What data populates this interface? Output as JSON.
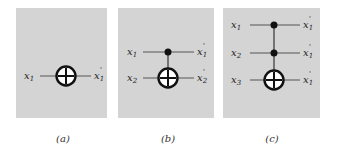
{
  "panels": [
    {
      "id": "a",
      "caption": "(a)",
      "inputs": [
        "x",
        "1"
      ],
      "gate": "NOT"
    },
    {
      "id": "b",
      "caption": "(b)",
      "gate": "CNOT"
    },
    {
      "id": "c",
      "caption": "(c)",
      "gate": "Toffoli"
    }
  ],
  "captions": {
    "a": "(a)",
    "b": "(b)",
    "c": "(c)"
  },
  "labels": {
    "a": {
      "in1": "x",
      "in1_sub": "1",
      "out1": "x",
      "out1_sub": "1"
    },
    "b": {
      "in1": "x",
      "in1_sub": "1",
      "in2": "x",
      "in2_sub": "2",
      "out1": "x",
      "out1_sub": "1",
      "out2": "x",
      "out2_sub": "2"
    },
    "c": {
      "in1": "x",
      "in1_sub": "1",
      "in2": "x",
      "in2_sub": "2",
      "in3": "x",
      "in3_sub": "3",
      "out1": "x",
      "out1_sub": "1",
      "out2": "x",
      "out2_sub": "1",
      "out3": "x",
      "out3_sub": "1"
    }
  },
  "colors": {
    "panel_bg": "#d4d4d4",
    "line": "#555555",
    "gate": "#111111"
  }
}
